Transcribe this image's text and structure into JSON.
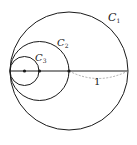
{
  "diagram": {
    "type": "nested tangent circles",
    "circles": [
      {
        "id": "C1",
        "label": "C",
        "subscript": "1",
        "cx": 69,
        "cy": 71,
        "r": 59
      },
      {
        "id": "C2",
        "label": "C",
        "subscript": "2",
        "cx": 39.5,
        "cy": 71,
        "r": 29.5
      },
      {
        "id": "C3",
        "label": "C",
        "subscript": "3",
        "cx": 24.5,
        "cy": 71,
        "r": 14.5
      }
    ],
    "diameter_line": {
      "x1": 10,
      "x2": 128,
      "y": 71
    },
    "points": [
      {
        "name": "center-C3",
        "x": 24.5,
        "y": 71
      },
      {
        "name": "center-C2",
        "x": 39.5,
        "y": 71
      },
      {
        "name": "center-C1",
        "x": 69,
        "y": 71
      }
    ],
    "radius_annotation": {
      "label": "1",
      "from_x": 69,
      "to_x": 128,
      "y": 71
    }
  },
  "colors": {
    "stroke": "#1a1a1a",
    "dashed": "#999999",
    "background": "#ffffff"
  }
}
